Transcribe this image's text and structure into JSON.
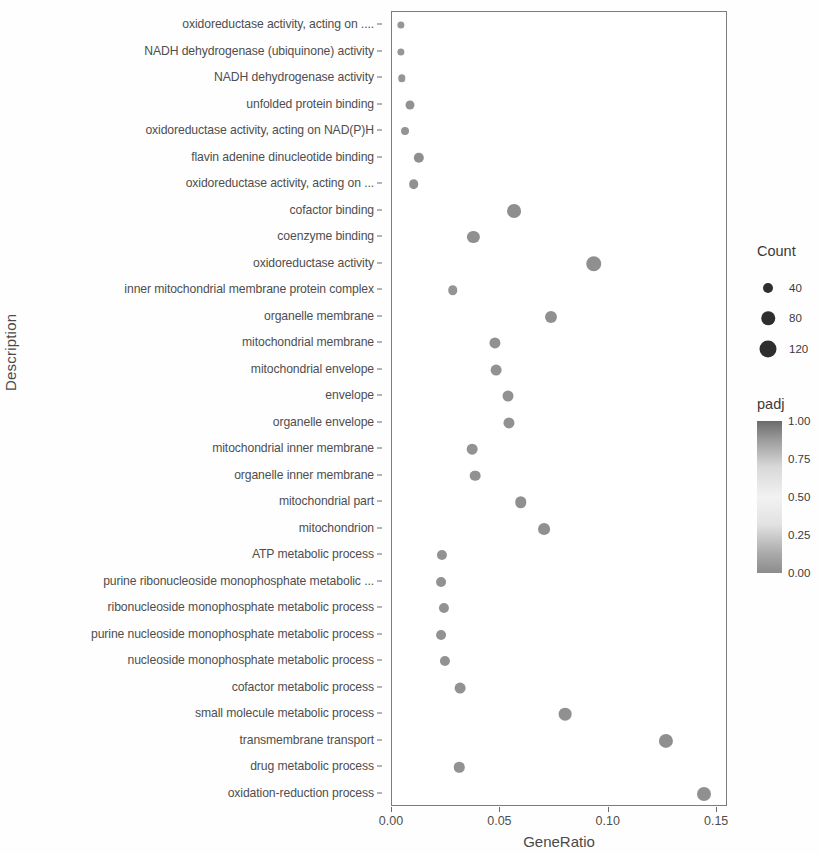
{
  "chart_data": {
    "type": "scatter",
    "title": "",
    "xlabel": "GeneRatio",
    "ylabel": "Description",
    "xlim": [
      0.0,
      0.155
    ],
    "xticks": [
      0.0,
      0.05,
      0.1,
      0.15
    ],
    "xticklabels": [
      "0.00",
      "0.05",
      "0.10",
      "0.15"
    ],
    "grid": false,
    "categories": [
      "oxidoreductase activity, acting on ....",
      "NADH dehydrogenase (ubiquinone) activity",
      "NADH dehydrogenase activity",
      "unfolded protein binding",
      "oxidoreductase activity, acting on NAD(P)H",
      "flavin adenine dinucleotide binding",
      "oxidoreductase activity, acting on ...",
      "cofactor binding",
      "coenzyme binding",
      "oxidoreductase activity",
      "inner mitochondrial membrane protein complex",
      "organelle membrane",
      "mitochondrial membrane",
      "mitochondrial envelope",
      "envelope",
      "organelle envelope",
      "mitochondrial inner membrane",
      "organelle inner membrane",
      "mitochondrial part",
      "mitochondrion",
      "ATP metabolic process",
      "purine ribonucleoside monophosphate metabolic ...",
      "ribonucleoside monophosphate metabolic process",
      "purine nucleoside monophosphate metabolic process",
      "nucleoside monophosphate metabolic process",
      "cofactor metabolic process",
      "small molecule metabolic process",
      "transmembrane transport",
      "drug metabolic process",
      "oxidation-reduction process"
    ],
    "points": [
      {
        "description": "oxidoreductase activity, acting on ....",
        "GeneRatio": 0.0042,
        "Count": 11,
        "padj": 0.02
      },
      {
        "description": "NADH dehydrogenase (ubiquinone) activity",
        "GeneRatio": 0.0042,
        "Count": 11,
        "padj": 0.02
      },
      {
        "description": "NADH dehydrogenase activity",
        "GeneRatio": 0.0044,
        "Count": 12,
        "padj": 0.03
      },
      {
        "description": "unfolded protein binding",
        "GeneRatio": 0.0082,
        "Count": 22,
        "padj": 0.18
      },
      {
        "description": "oxidoreductase activity, acting on NAD(P)H",
        "GeneRatio": 0.0058,
        "Count": 15,
        "padj": 0.09
      },
      {
        "description": "flavin adenine dinucleotide binding",
        "GeneRatio": 0.0125,
        "Count": 33,
        "padj": 0.3
      },
      {
        "description": "oxidoreductase activity, acting on ...",
        "GeneRatio": 0.01,
        "Count": 27,
        "padj": 0.24
      },
      {
        "description": "cofactor binding",
        "GeneRatio": 0.0565,
        "Count": 72,
        "padj": 0.33
      },
      {
        "description": "coenzyme binding",
        "GeneRatio": 0.0375,
        "Count": 52,
        "padj": 0.29
      },
      {
        "description": "oxidoreductase activity",
        "GeneRatio": 0.093,
        "Count": 96,
        "padj": 0.34
      },
      {
        "description": "inner mitochondrial membrane protein complex",
        "GeneRatio": 0.028,
        "Count": 26,
        "padj": 0.11
      },
      {
        "description": "organelle membrane",
        "GeneRatio": 0.0735,
        "Count": 50,
        "padj": 0.26
      },
      {
        "description": "mitochondrial membrane",
        "GeneRatio": 0.0475,
        "Count": 40,
        "padj": 0.22
      },
      {
        "description": "mitochondrial envelope",
        "GeneRatio": 0.048,
        "Count": 37,
        "padj": 0.2
      },
      {
        "description": "envelope",
        "GeneRatio": 0.0535,
        "Count": 39,
        "padj": 0.24
      },
      {
        "description": "organelle envelope",
        "GeneRatio": 0.054,
        "Count": 40,
        "padj": 0.24
      },
      {
        "description": "mitochondrial inner membrane",
        "GeneRatio": 0.037,
        "Count": 36,
        "padj": 0.2
      },
      {
        "description": "organelle inner membrane",
        "GeneRatio": 0.0385,
        "Count": 36,
        "padj": 0.22
      },
      {
        "description": "mitochondrial part",
        "GeneRatio": 0.0595,
        "Count": 44,
        "padj": 0.28
      },
      {
        "description": "mitochondrion",
        "GeneRatio": 0.07,
        "Count": 48,
        "padj": 0.28
      },
      {
        "description": "ATP metabolic process",
        "GeneRatio": 0.023,
        "Count": 31,
        "padj": 0.17
      },
      {
        "description": "purine ribonucleoside monophosphate metabolic ...",
        "GeneRatio": 0.0225,
        "Count": 29,
        "padj": 0.17
      },
      {
        "description": "ribonucleoside monophosphate metabolic process",
        "GeneRatio": 0.024,
        "Count": 31,
        "padj": 0.17
      },
      {
        "description": "purine nucleoside monophosphate metabolic process",
        "GeneRatio": 0.0228,
        "Count": 29,
        "padj": 0.17
      },
      {
        "description": "nucleoside monophosphate metabolic process",
        "GeneRatio": 0.0243,
        "Count": 31,
        "padj": 0.17
      },
      {
        "description": "cofactor metabolic process",
        "GeneRatio": 0.0315,
        "Count": 37,
        "padj": 0.18
      },
      {
        "description": "small molecule metabolic process",
        "GeneRatio": 0.08,
        "Count": 58,
        "padj": 0.28
      },
      {
        "description": "transmembrane transport",
        "GeneRatio": 0.1265,
        "Count": 76,
        "padj": 0.3
      },
      {
        "description": "drug metabolic process",
        "GeneRatio": 0.031,
        "Count": 34,
        "padj": 0.19
      },
      {
        "description": "oxidation-reduction process",
        "GeneRatio": 0.144,
        "Count": 74,
        "padj": 0.26
      }
    ],
    "legends": [
      {
        "name": "Count",
        "title": "Count",
        "type": "size",
        "entries": [
          {
            "label": "40",
            "value": 40
          },
          {
            "label": "80",
            "value": 80
          },
          {
            "label": "120",
            "value": 120
          }
        ]
      },
      {
        "name": "padj",
        "title": "padj",
        "type": "colorbar",
        "ticklabels": [
          "1.00",
          "0.75",
          "0.50",
          "0.25",
          "0.00"
        ],
        "tickvalues": [
          1.0,
          0.75,
          0.5,
          0.25,
          0.0
        ],
        "high_color": "#6b6b6b",
        "low_color": "#8c8c8c",
        "mid_color": "#f2f2f2"
      }
    ],
    "dot_color": "#8d8d8d",
    "panel_border_color": "#7c7c7c"
  }
}
